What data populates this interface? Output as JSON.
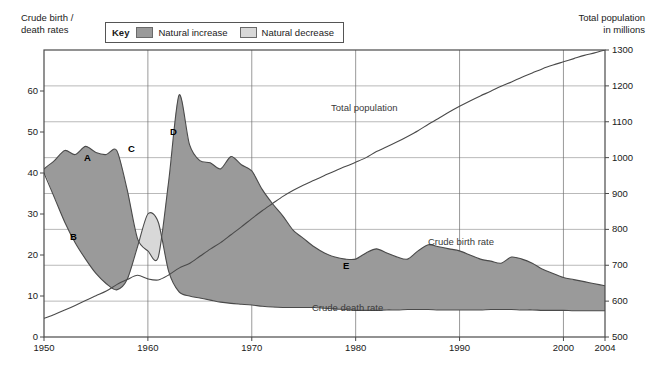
{
  "axes": {
    "left_title": "Crude birth /\ndeath rates",
    "right_title": "Total population\nin millions",
    "left_ticks": [
      "0",
      "10",
      "20",
      "30",
      "40",
      "50",
      "60"
    ],
    "right_ticks": [
      "500",
      "600",
      "700",
      "800",
      "900",
      "1000",
      "1100",
      "1200",
      "1300"
    ],
    "x_ticks": [
      "1950",
      "1960",
      "1970",
      "1980",
      "1990",
      "2000",
      "2004"
    ]
  },
  "key": {
    "title": "Key",
    "entries": [
      {
        "label": "Natural increase",
        "color": "#9a9a9a"
      },
      {
        "label": "Natural decrease",
        "color": "#d8d8d8"
      }
    ]
  },
  "annotations": {
    "total_population": "Total population",
    "crude_birth_rate": "Crude birth rate",
    "crude_death_rate": "Crude death rate",
    "a": "A",
    "b": "B",
    "c": "C",
    "d": "D",
    "e": "E"
  },
  "chart_data": {
    "type": "line",
    "title": "",
    "xlabel": "",
    "ylabel": "Crude birth / death rates",
    "ylabel_right": "Total population in millions",
    "xlim": [
      1950,
      2004
    ],
    "ylim": [
      0,
      70
    ],
    "ylim_right": [
      500,
      1300
    ],
    "grid": true,
    "legend_position": "top-center",
    "fill_regions": [
      {
        "name": "Natural increase",
        "color": "#9a9a9a",
        "between": [
          "Crude birth rate",
          "Crude death rate"
        ],
        "condition": "birth > death"
      },
      {
        "name": "Natural decrease",
        "color": "#d8d8d8",
        "between": [
          "Crude death rate",
          "Crude birth rate"
        ],
        "condition": "death > birth"
      }
    ],
    "x": [
      1950,
      1951,
      1952,
      1953,
      1954,
      1955,
      1956,
      1957,
      1958,
      1959,
      1960,
      1961,
      1962,
      1963,
      1964,
      1965,
      1966,
      1967,
      1968,
      1969,
      1970,
      1971,
      1972,
      1973,
      1974,
      1975,
      1976,
      1977,
      1978,
      1979,
      1980,
      1981,
      1982,
      1983,
      1984,
      1985,
      1986,
      1987,
      1988,
      1989,
      1990,
      1991,
      1992,
      1993,
      1994,
      1995,
      1996,
      1997,
      1998,
      1999,
      2000,
      2001,
      2002,
      2003,
      2004
    ],
    "series": [
      {
        "name": "Crude birth rate",
        "axis": "left",
        "units": "per 1000",
        "values": [
          41.0,
          43.0,
          45.5,
          44.5,
          46.5,
          45.0,
          44.5,
          45.5,
          36.0,
          24.0,
          21.0,
          19.5,
          38.0,
          59.0,
          47.0,
          43.0,
          42.5,
          41.0,
          44.0,
          42.0,
          40.5,
          36.0,
          32.5,
          29.5,
          26.0,
          24.0,
          22.0,
          20.5,
          19.5,
          19.0,
          19.0,
          20.5,
          21.5,
          20.5,
          19.5,
          19.0,
          21.0,
          22.5,
          22.0,
          21.5,
          21.0,
          20.0,
          19.0,
          18.5,
          18.0,
          19.5,
          19.0,
          18.0,
          16.5,
          15.5,
          14.5,
          14.0,
          13.5,
          13.0,
          12.5
        ]
      },
      {
        "name": "Crude death rate",
        "axis": "left",
        "units": "per 1000",
        "values": [
          40.0,
          34.0,
          28.0,
          23.0,
          19.0,
          15.5,
          13.0,
          11.5,
          14.0,
          22.0,
          30.0,
          28.0,
          16.0,
          11.0,
          10.0,
          9.5,
          9.0,
          8.5,
          8.2,
          8.0,
          7.8,
          7.5,
          7.3,
          7.2,
          7.2,
          7.2,
          7.2,
          7.0,
          6.8,
          6.7,
          6.5,
          6.5,
          6.5,
          6.6,
          6.6,
          6.7,
          6.7,
          6.7,
          6.6,
          6.6,
          6.6,
          6.6,
          6.6,
          6.7,
          6.7,
          6.7,
          6.6,
          6.6,
          6.5,
          6.5,
          6.5,
          6.4,
          6.4,
          6.4,
          6.4
        ]
      },
      {
        "name": "Total population",
        "axis": "right",
        "units": "millions",
        "values": [
          552,
          563,
          575,
          588,
          602,
          615,
          628,
          646,
          660,
          672,
          662,
          659,
          673,
          692,
          705,
          725,
          745,
          763,
          785,
          807,
          830,
          852,
          872,
          892,
          909,
          924,
          937,
          950,
          963,
          975,
          987,
          1000,
          1017,
          1030,
          1044,
          1059,
          1075,
          1093,
          1110,
          1127,
          1143,
          1158,
          1172,
          1185,
          1199,
          1211,
          1224,
          1236,
          1248,
          1258,
          1267,
          1276,
          1285,
          1292,
          1300
        ]
      }
    ],
    "annotations": [
      {
        "label": "A",
        "x": 1953.5,
        "y": 47,
        "note": "post-revolution recovery, high natural increase"
      },
      {
        "label": "B",
        "x": 1952.8,
        "y": 28,
        "note": "rapid fall in crude death rate"
      },
      {
        "label": "C",
        "x": 1959.5,
        "y": 49,
        "note": "Great Leap Forward famine, natural decrease"
      },
      {
        "label": "D",
        "x": 1963.5,
        "y": 54,
        "note": "post-famine baby boom peak"
      },
      {
        "label": "E",
        "x": 1981.5,
        "y": 21,
        "note": "one-child policy, low natural increase"
      }
    ]
  }
}
